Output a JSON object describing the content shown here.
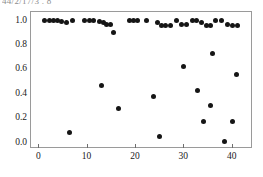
{
  "header_fragment": "44/2/17/3 . 8",
  "chart_data": {
    "type": "scatter",
    "title": "",
    "subtitle": "",
    "xlabel": "",
    "ylabel": "",
    "xlim": [
      -1.5,
      44.0
    ],
    "ylim": [
      -0.045,
      1.07
    ],
    "xticks": [
      0,
      10,
      20,
      30,
      40
    ],
    "xtick_labels": [
      "0",
      "10",
      "20",
      "30",
      "40"
    ],
    "yticks": [
      0.0,
      0.2,
      0.4,
      0.6,
      0.8,
      1.0
    ],
    "ytick_labels": [
      "0.0",
      "0.2",
      "0.4",
      "0.6",
      "0.8",
      "1.0"
    ],
    "grid": false,
    "legend": null,
    "marker": "filled-circle",
    "marker_color": "#151515",
    "marker_size": 5,
    "frame_color": "#9a9a9a",
    "background": "#ffffff",
    "n_points": 49,
    "points": [
      {
        "x": 1.2,
        "y": 1.0
      },
      {
        "x": 2.3,
        "y": 1.0
      },
      {
        "x": 3.1,
        "y": 1.0
      },
      {
        "x": 4.0,
        "y": 1.0
      },
      {
        "x": 4.9,
        "y": 0.99
      },
      {
        "x": 5.8,
        "y": 0.98
      },
      {
        "x": 7.0,
        "y": 1.0
      },
      {
        "x": 9.6,
        "y": 1.0
      },
      {
        "x": 10.5,
        "y": 1.0
      },
      {
        "x": 11.4,
        "y": 1.0
      },
      {
        "x": 12.6,
        "y": 0.99
      },
      {
        "x": 13.4,
        "y": 0.98
      },
      {
        "x": 14.1,
        "y": 0.97
      },
      {
        "x": 14.9,
        "y": 0.97
      },
      {
        "x": 15.6,
        "y": 0.9
      },
      {
        "x": 18.8,
        "y": 1.0
      },
      {
        "x": 19.7,
        "y": 1.0
      },
      {
        "x": 20.6,
        "y": 1.0
      },
      {
        "x": 22.4,
        "y": 1.0
      },
      {
        "x": 24.6,
        "y": 0.98
      },
      {
        "x": 25.5,
        "y": 0.96
      },
      {
        "x": 26.4,
        "y": 0.96
      },
      {
        "x": 27.3,
        "y": 0.96
      },
      {
        "x": 28.6,
        "y": 1.0
      },
      {
        "x": 29.6,
        "y": 0.97
      },
      {
        "x": 30.6,
        "y": 0.97
      },
      {
        "x": 31.8,
        "y": 1.0
      },
      {
        "x": 32.7,
        "y": 1.0
      },
      {
        "x": 33.7,
        "y": 0.98
      },
      {
        "x": 34.7,
        "y": 0.96
      },
      {
        "x": 35.6,
        "y": 0.96
      },
      {
        "x": 36.7,
        "y": 1.0
      },
      {
        "x": 38.0,
        "y": 1.0
      },
      {
        "x": 39.1,
        "y": 0.97
      },
      {
        "x": 40.1,
        "y": 0.96
      },
      {
        "x": 41.2,
        "y": 0.96
      },
      {
        "x": 6.5,
        "y": 0.08
      },
      {
        "x": 13.0,
        "y": 0.47
      },
      {
        "x": 16.5,
        "y": 0.28
      },
      {
        "x": 23.8,
        "y": 0.38
      },
      {
        "x": 25.0,
        "y": 0.05
      },
      {
        "x": 30.0,
        "y": 0.62
      },
      {
        "x": 33.0,
        "y": 0.43
      },
      {
        "x": 34.2,
        "y": 0.17
      },
      {
        "x": 35.6,
        "y": 0.3
      },
      {
        "x": 36.0,
        "y": 0.73
      },
      {
        "x": 38.5,
        "y": 0.01
      },
      {
        "x": 40.2,
        "y": 0.17
      },
      {
        "x": 41.0,
        "y": 0.56
      }
    ]
  }
}
